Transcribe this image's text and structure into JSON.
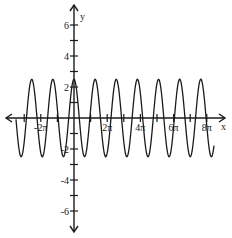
{
  "chart_data": {
    "type": "line",
    "title": "",
    "xlabel": "x",
    "ylabel": "y",
    "function": "y = 2.5 cos(pi x / 2)",
    "amplitude": 2.5,
    "period": 4,
    "x_range": [
      -3.5,
      8.4
    ],
    "xlim_units_of_pi": [
      -4,
      9
    ],
    "ylim": [
      -7,
      7
    ],
    "x_ticks_pi": [
      -3,
      -2,
      -1,
      1,
      2,
      3,
      4,
      5,
      6,
      7,
      8
    ],
    "x_tick_labels": [
      {
        "pi": -2,
        "text": "-2π"
      },
      {
        "pi": 2,
        "text": "2π"
      },
      {
        "pi": 4,
        "text": "4π"
      },
      {
        "pi": 6,
        "text": "6π"
      },
      {
        "pi": 8,
        "text": "8π"
      }
    ],
    "y_ticks": [
      -6,
      -5,
      -4,
      -3,
      -2,
      -1,
      1,
      2,
      3,
      4,
      5,
      6
    ],
    "y_tick_labels": [
      {
        "v": 6,
        "text": "6"
      },
      {
        "v": 4,
        "text": "4"
      },
      {
        "v": 2,
        "text": "2"
      },
      {
        "v": -2,
        "text": "-2"
      },
      {
        "v": -4,
        "text": "-4"
      },
      {
        "v": -6,
        "text": "-6"
      }
    ],
    "grid": false,
    "legend": null
  },
  "layout": {
    "origin_x": 74,
    "origin_y": 118,
    "px_per_pi": 16.6,
    "px_per_y": 15.5,
    "x_axis_left": 6,
    "x_axis_right": 225,
    "y_axis_top": 5,
    "y_axis_bottom": 232,
    "curve_x_start_px": 16,
    "curve_x_end_px": 214,
    "line_color": "#1a1a1a"
  }
}
